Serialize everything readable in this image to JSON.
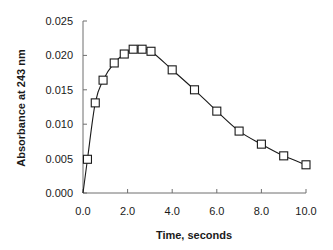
{
  "chart_data": {
    "type": "line",
    "title": "",
    "xlabel": "Time, seconds",
    "ylabel": "Absorbance at 243 nm",
    "xlim": [
      0,
      10
    ],
    "ylim": [
      0,
      0.025
    ],
    "x_ticks": [
      "0.0",
      "2.0",
      "4.0",
      "6.0",
      "8.0",
      "10.0"
    ],
    "y_ticks": [
      "0.000",
      "0.005",
      "0.010",
      "0.015",
      "0.020",
      "0.025"
    ],
    "grid": false,
    "legend": null,
    "marker": "open-square",
    "series": [
      {
        "name": "Absorbance",
        "x": [
          0.2,
          0.55,
          0.9,
          1.4,
          1.85,
          2.25,
          2.65,
          3.05,
          4.0,
          5.0,
          6.0,
          7.0,
          8.0,
          9.0,
          10.0
        ],
        "values": [
          0.0049,
          0.0131,
          0.0164,
          0.0189,
          0.0202,
          0.0209,
          0.0209,
          0.0206,
          0.0179,
          0.015,
          0.0119,
          0.009,
          0.0071,
          0.0054,
          0.0041
        ]
      }
    ]
  },
  "colors": {
    "axis": "#6e6e6e",
    "series": "#1a1a1a",
    "background": "#ffffff"
  }
}
